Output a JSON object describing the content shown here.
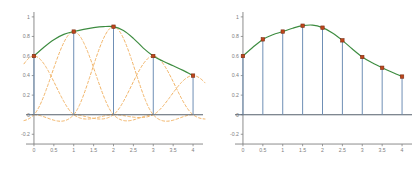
{
  "figure": {
    "title": "",
    "background": "#ffffff",
    "width": 418,
    "height": 172
  },
  "colors": {
    "curve": "#3d8c40",
    "stem": "#6f8fb5",
    "marker_face": "#c0461c",
    "marker_edge": "#7a2d12",
    "basis": "#f0b060",
    "axis": "#808080",
    "zero_line": "#555f6b",
    "tick_label": "#808080"
  },
  "axes": {
    "xlabel": "",
    "ylabel": "",
    "xlim": [
      -0.2,
      4.25
    ],
    "ylim": [
      -0.32,
      1.05
    ],
    "xticks": [
      0,
      0.5,
      1,
      1.5,
      2,
      2.5,
      3,
      3.5,
      4
    ],
    "xticklabels": [
      "0",
      "0.5",
      "1",
      "1.5",
      "2",
      "2.5",
      "3",
      "3.5",
      "4"
    ],
    "yticks": [
      -0.2,
      0,
      0.2,
      0.4,
      0.6,
      0.8,
      1
    ],
    "yticklabels": [
      "-0.2",
      "0",
      "0.2",
      "0.4",
      "0.6",
      "0.8",
      "1"
    ],
    "grid": false,
    "legend": "none"
  },
  "chart_data": [
    {
      "type": "line",
      "name": "left-panel-coarse-interpolation",
      "title": "",
      "xlabel": "",
      "ylabel": "",
      "xlim": [
        -0.2,
        4.25
      ],
      "ylim": [
        -0.32,
        1.05
      ],
      "grid": false,
      "legend": "none",
      "xticks": [
        0,
        0.5,
        1,
        1.5,
        2,
        2.5,
        3,
        3.5,
        4
      ],
      "xticklabels": [
        "0",
        "0.5",
        "1",
        "1.5",
        "2",
        "2.5",
        "3",
        "3.5",
        "4"
      ],
      "yticks": [
        -0.2,
        0,
        0.2,
        0.4,
        0.6,
        0.8,
        1
      ],
      "yticklabels": [
        "-0.2",
        "0",
        "0.2",
        "0.4",
        "0.6",
        "0.8",
        "1"
      ],
      "series": [
        {
          "name": "interpolant",
          "style": "solid",
          "color": "#3d8c40",
          "x": [
            0,
            0.25,
            0.5,
            0.75,
            1,
            1.25,
            1.5,
            1.75,
            2,
            2.25,
            2.5,
            2.75,
            3,
            3.25,
            3.5,
            3.75,
            4
          ],
          "values": [
            0.6,
            0.69,
            0.767,
            0.821,
            0.85,
            0.872,
            0.89,
            0.901,
            0.9,
            0.861,
            0.781,
            0.681,
            0.6,
            0.546,
            0.5,
            0.453,
            0.4
          ]
        },
        {
          "name": "samples",
          "style": "markers+stems",
          "color": "#c0461c",
          "x": [
            0,
            1,
            2,
            3,
            4
          ],
          "values": [
            0.6,
            0.85,
            0.9,
            0.6,
            0.4
          ]
        }
      ],
      "basis_functions": {
        "style": "dashed",
        "color": "#f0b060",
        "description": "scaled cardinal cubic spline basis, one per knot",
        "knots": [
          0,
          1,
          2,
          3,
          4
        ],
        "scales": [
          0.6,
          0.85,
          0.9,
          0.6,
          0.4
        ],
        "peak": 1.0,
        "min_lobe": -0.22
      }
    },
    {
      "type": "line",
      "name": "right-panel-fine-interpolation",
      "title": "",
      "xlabel": "",
      "ylabel": "",
      "xlim": [
        -0.2,
        4.25
      ],
      "ylim": [
        -0.32,
        1.05
      ],
      "grid": false,
      "legend": "none",
      "xticks": [
        0,
        0.5,
        1,
        1.5,
        2,
        2.5,
        3,
        3.5,
        4
      ],
      "xticklabels": [
        "0",
        "0.5",
        "1",
        "1.5",
        "2",
        "2.5",
        "3",
        "3.5",
        "4"
      ],
      "yticks": [
        -0.2,
        0,
        0.2,
        0.4,
        0.6,
        0.8,
        1
      ],
      "yticklabels": [
        "-0.2",
        "0",
        "0.2",
        "0.4",
        "0.6",
        "0.8",
        "1"
      ],
      "series": [
        {
          "name": "interpolant",
          "style": "solid",
          "color": "#3d8c40",
          "x": [
            0,
            0.25,
            0.5,
            0.75,
            1,
            1.25,
            1.5,
            1.75,
            2,
            2.25,
            2.5,
            2.75,
            3,
            3.25,
            3.5,
            3.75,
            4
          ],
          "values": [
            0.6,
            0.69,
            0.77,
            0.818,
            0.85,
            0.884,
            0.91,
            0.916,
            0.89,
            0.836,
            0.76,
            0.672,
            0.59,
            0.53,
            0.48,
            0.434,
            0.39
          ]
        },
        {
          "name": "samples",
          "style": "markers+stems",
          "color": "#c0461c",
          "x": [
            0,
            0.5,
            1,
            1.5,
            2,
            2.5,
            3,
            3.5,
            4
          ],
          "values": [
            0.6,
            0.77,
            0.85,
            0.91,
            0.89,
            0.76,
            0.59,
            0.48,
            0.39
          ]
        }
      ]
    }
  ]
}
